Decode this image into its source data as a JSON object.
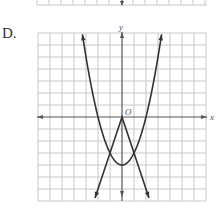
{
  "option": {
    "label": "D."
  },
  "graph": {
    "x_axis_label": "x",
    "y_axis_label": "y",
    "origin_label": "O",
    "grid": {
      "xmin": -7,
      "xmax": 7,
      "ymin": -7,
      "ymax": 7,
      "step": 1
    },
    "colors": {
      "grid": "#c8c8c8",
      "axis": "#555555",
      "curve": "#333333"
    }
  },
  "chart_data": {
    "type": "line",
    "title": "",
    "xlabel": "x",
    "ylabel": "y",
    "xlim": [
      -7,
      7
    ],
    "ylim": [
      -7,
      7
    ],
    "grid": true,
    "series": [
      {
        "name": "parabola",
        "equation": "y = x^2 - 4",
        "vertex": [
          0,
          -4
        ],
        "x_intercepts": [
          -2,
          2
        ],
        "arrows_at_ends": true
      },
      {
        "name": "absolute-value",
        "equation": "y = -3|x|",
        "vertex": [
          0,
          0
        ],
        "opens": "down",
        "arrows_at_ends": true
      }
    ],
    "intersections": [
      [
        -1,
        -3
      ],
      [
        1,
        -3
      ]
    ]
  }
}
